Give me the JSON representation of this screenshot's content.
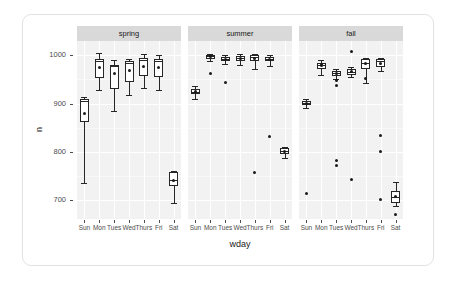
{
  "chart_data": {
    "type": "boxplot",
    "title": "",
    "xlabel": "wday",
    "ylabel": "n",
    "facet_variable": "season",
    "facets": [
      "spring",
      "summer",
      "fall"
    ],
    "categories": [
      "Sun",
      "Mon",
      "Tues",
      "Wed",
      "Thurs",
      "Fri",
      "Sat"
    ],
    "ylim": [
      660,
      1030
    ],
    "yticks": [
      700,
      800,
      900,
      1000
    ],
    "ytick_labels": [
      "700",
      "800",
      "900",
      "1000"
    ],
    "grid": "white gridlines on light gray panel",
    "legend": "none",
    "panels": [
      {
        "facet": "spring",
        "boxes": [
          {
            "x": "Sun",
            "lower_whisker": 735,
            "q1": 861,
            "median": 905,
            "q3": 910,
            "upper_whisker": 913,
            "mean": 879,
            "outliers": []
          },
          {
            "x": "Mon",
            "lower_whisker": 929,
            "q1": 954,
            "median": 988,
            "q3": 992,
            "upper_whisker": 1006,
            "mean": 975,
            "outliers": []
          },
          {
            "x": "Tues",
            "lower_whisker": 884,
            "q1": 931,
            "median": 977,
            "q3": 981,
            "upper_whisker": 990,
            "mean": 962,
            "outliers": []
          },
          {
            "x": "Wed",
            "lower_whisker": 918,
            "q1": 944,
            "median": 984,
            "q3": 989,
            "upper_whisker": 993,
            "mean": 968,
            "outliers": []
          },
          {
            "x": "Thurs",
            "lower_whisker": 933,
            "q1": 958,
            "median": 990,
            "q3": 995,
            "upper_whisker": 1004,
            "mean": 978,
            "outliers": []
          },
          {
            "x": "Fri",
            "lower_whisker": 928,
            "q1": 955,
            "median": 988,
            "q3": 992,
            "upper_whisker": 1000,
            "mean": 975,
            "outliers": []
          },
          {
            "x": "Sat",
            "lower_whisker": 694,
            "q1": 728,
            "median": 741,
            "q3": 757,
            "upper_whisker": 760,
            "mean": 740,
            "outliers": []
          }
        ]
      },
      {
        "facet": "summer",
        "boxes": [
          {
            "x": "Sun",
            "lower_whisker": 910,
            "q1": 919,
            "median": 924,
            "q3": 930,
            "upper_whisker": 936,
            "mean": 924,
            "outliers": []
          },
          {
            "x": "Mon",
            "lower_whisker": 988,
            "q1": 993,
            "median": 998,
            "q3": 1001,
            "upper_whisker": 1004,
            "mean": 997,
            "outliers": [
              962
            ]
          },
          {
            "x": "Tues",
            "lower_whisker": 983,
            "q1": 988,
            "median": 993,
            "q3": 996,
            "upper_whisker": 1000,
            "mean": 992,
            "outliers": [
              944
            ]
          },
          {
            "x": "Wed",
            "lower_whisker": 980,
            "q1": 988,
            "median": 995,
            "q3": 999,
            "upper_whisker": 1003,
            "mean": 993,
            "outliers": []
          },
          {
            "x": "Thurs",
            "lower_whisker": 972,
            "q1": 989,
            "median": 996,
            "q3": 1000,
            "upper_whisker": 1003,
            "mean": 993,
            "outliers": [
              757
            ]
          },
          {
            "x": "Fri",
            "lower_whisker": 978,
            "q1": 988,
            "median": 993,
            "q3": 997,
            "upper_whisker": 1000,
            "mean": 992,
            "outliers": [
              832
            ]
          },
          {
            "x": "Sat",
            "lower_whisker": 786,
            "q1": 796,
            "median": 802,
            "q3": 807,
            "upper_whisker": 810,
            "mean": 801,
            "outliers": []
          }
        ]
      },
      {
        "facet": "fall",
        "boxes": [
          {
            "x": "Sun",
            "lower_whisker": 890,
            "q1": 896,
            "median": 901,
            "q3": 906,
            "upper_whisker": 910,
            "mean": 900,
            "outliers": [
              714
            ]
          },
          {
            "x": "Mon",
            "lower_whisker": 960,
            "q1": 972,
            "median": 980,
            "q3": 984,
            "upper_whisker": 990,
            "mean": 979,
            "outliers": [
              982
            ]
          },
          {
            "x": "Tues",
            "lower_whisker": 952,
            "q1": 958,
            "median": 963,
            "q3": 967,
            "upper_whisker": 971,
            "mean": 963,
            "outliers": [
              948,
              938,
              781,
              772
            ]
          },
          {
            "x": "Wed",
            "lower_whisker": 955,
            "q1": 960,
            "median": 966,
            "q3": 972,
            "upper_whisker": 975,
            "mean": 967,
            "outliers": [
              1008,
              742
            ]
          },
          {
            "x": "Thurs",
            "lower_whisker": 942,
            "q1": 971,
            "median": 985,
            "q3": 992,
            "upper_whisker": 995,
            "mean": 983,
            "outliers": [
              952
            ]
          },
          {
            "x": "Fri",
            "lower_whisker": 968,
            "q1": 976,
            "median": 988,
            "q3": 992,
            "upper_whisker": 995,
            "mean": 984,
            "outliers": [
              833,
              800,
              700
            ]
          },
          {
            "x": "Sat",
            "lower_whisker": 686,
            "q1": 694,
            "median": 706,
            "q3": 718,
            "upper_whisker": 736,
            "mean": 707,
            "outliers": [
              670
            ]
          }
        ]
      }
    ]
  },
  "style": {
    "panel_bg": "#f2f2f2",
    "grid_major": "#ffffff",
    "strip_bg": "#d9d9d9",
    "ink": "#262626",
    "axis_text": "#4d4d4d",
    "card_border": "#e2e2e6"
  }
}
